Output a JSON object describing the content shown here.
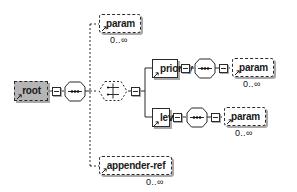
{
  "diagram": {
    "type": "xsd-tree",
    "background_color": "#ffffff",
    "line_color": "#2b2b2b",
    "root_fill_color": "#b5b5b5",
    "shadow_color": "#8c8c8c"
  },
  "nodes": {
    "root": {
      "label": "root",
      "kind": "element",
      "style": "selected-optional",
      "occurs": ""
    },
    "root_sequence": {
      "label": "sequence-compositor-icon",
      "kind": "compositor",
      "compositor": "sequence"
    },
    "root_toggle": {
      "label": "collapse-toggle",
      "kind": "toggle"
    },
    "param_top": {
      "label": "param",
      "kind": "element",
      "style": "optional",
      "occurs": "0..∞"
    },
    "choice": {
      "label": "choice-compositor-icon",
      "kind": "compositor",
      "compositor": "choice",
      "style": "optional"
    },
    "choice_toggle": {
      "label": "collapse-toggle",
      "kind": "toggle"
    },
    "priority": {
      "label": "priority",
      "kind": "element",
      "style": "required",
      "occurs": ""
    },
    "priority_sequence": {
      "label": "sequence-compositor-icon",
      "kind": "compositor",
      "compositor": "sequence"
    },
    "param_priority": {
      "label": "param",
      "kind": "element",
      "style": "optional",
      "occurs": "0..∞"
    },
    "level": {
      "label": "level",
      "kind": "element",
      "style": "required",
      "occurs": ""
    },
    "level_sequence": {
      "label": "sequence-compositor-icon",
      "kind": "compositor",
      "compositor": "sequence"
    },
    "param_level": {
      "label": "param",
      "kind": "element",
      "style": "optional",
      "occurs": "0..∞"
    },
    "appender_ref": {
      "label": "appender-ref",
      "kind": "element",
      "style": "optional",
      "occurs": "0..∞"
    }
  },
  "occurrences": {
    "param_top": "0..∞",
    "param_priority": "0..∞",
    "param_level": "0..∞",
    "appender_ref": "0..∞"
  }
}
